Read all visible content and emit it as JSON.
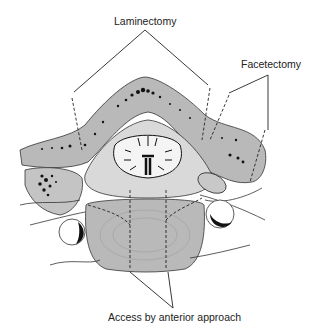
{
  "figure": {
    "type": "anatomical cross-section of vertebra",
    "labels": {
      "laminectomy": "Laminectomy",
      "facetectomy": "Facetectomy",
      "anterior": "Access by anterior approach"
    },
    "colors": {
      "bone_gray": "#b9b9b9",
      "light_gray": "#d9d9d9",
      "outline": "#333333",
      "marrow_dots": "#111111",
      "background": "#ffffff"
    }
  }
}
